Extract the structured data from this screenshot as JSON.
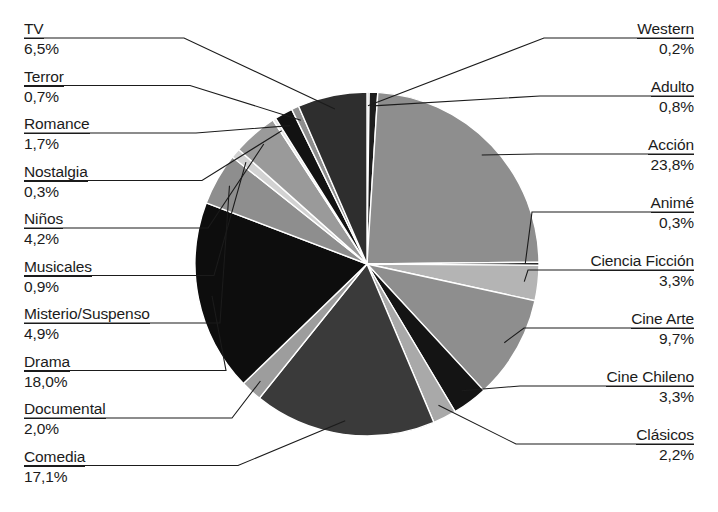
{
  "chart_data": {
    "type": "pie",
    "title": "",
    "xlabel": "",
    "ylabel": "",
    "legend_position": "callout-labels",
    "grid": false,
    "value_suffix": "%",
    "decimal_separator": ",",
    "categories": [
      "Western",
      "Adulto",
      "Acción",
      "Animé",
      "Ciencia Ficción",
      "Cine Arte",
      "Cine Chileno",
      "Clásicos",
      "Comedia",
      "Documental",
      "Drama",
      "Misterio/Suspenso",
      "Musicales",
      "Niños",
      "Nostalgia",
      "Romance",
      "Terror",
      "TV"
    ],
    "values": [
      0.2,
      0.8,
      23.8,
      0.3,
      3.3,
      9.7,
      3.3,
      2.2,
      17.1,
      2.0,
      18.0,
      4.9,
      0.9,
      4.2,
      0.3,
      1.7,
      0.7,
      6.5
    ],
    "labels": [
      {
        "name": "Western",
        "pct": "0,2%",
        "value": 0.2,
        "fill": "#7d7d7d"
      },
      {
        "name": "Adulto",
        "pct": "0,8%",
        "value": 0.8,
        "fill": "#1d1d1d"
      },
      {
        "name": "Acción",
        "pct": "23,8%",
        "value": 23.8,
        "fill": "#8e8e8e"
      },
      {
        "name": "Animé",
        "pct": "0,3%",
        "value": 0.3,
        "fill": "#2a2a2a"
      },
      {
        "name": "Ciencia Ficción",
        "pct": "3,3%",
        "value": 3.3,
        "fill": "#b4b4b4"
      },
      {
        "name": "Cine Arte",
        "pct": "9,7%",
        "value": 9.7,
        "fill": "#8e8e8e"
      },
      {
        "name": "Cine Chileno",
        "pct": "3,3%",
        "value": 3.3,
        "fill": "#141414"
      },
      {
        "name": "Clásicos",
        "pct": "2,2%",
        "value": 2.2,
        "fill": "#a9a9a9"
      },
      {
        "name": "Comedia",
        "pct": "17,1%",
        "value": 17.1,
        "fill": "#3a3a3a"
      },
      {
        "name": "Documental",
        "pct": "2,0%",
        "value": 2.0,
        "fill": "#9d9d9d"
      },
      {
        "name": "Drama",
        "pct": "18,0%",
        "value": 18.0,
        "fill": "#0d0d0d"
      },
      {
        "name": "Misterio/Suspenso",
        "pct": "4,9%",
        "value": 4.9,
        "fill": "#8e8e8e"
      },
      {
        "name": "Musicales",
        "pct": "0,9%",
        "value": 0.9,
        "fill": "#d2d2d2"
      },
      {
        "name": "Niños",
        "pct": "4,2%",
        "value": 4.2,
        "fill": "#9a9a9a"
      },
      {
        "name": "Nostalgia",
        "pct": "0,3%",
        "value": 0.3,
        "fill": "#e6e6e6"
      },
      {
        "name": "Romance",
        "pct": "1,7%",
        "value": 1.7,
        "fill": "#121212"
      },
      {
        "name": "Terror",
        "pct": "0,7%",
        "value": 0.7,
        "fill": "#8e8e8e"
      },
      {
        "name": "TV",
        "pct": "6,5%",
        "value": 6.5,
        "fill": "#2e2e2e"
      }
    ]
  },
  "left_labels": [
    {
      "name": "TV",
      "pct": "6,5%"
    },
    {
      "name": "Terror",
      "pct": "0,7%"
    },
    {
      "name": "Romance",
      "pct": "1,7%"
    },
    {
      "name": "Nostalgia",
      "pct": "0,3%"
    },
    {
      "name": "Niños",
      "pct": "4,2%"
    },
    {
      "name": "Musicales",
      "pct": "0,9%"
    },
    {
      "name": "Misterio/Suspenso",
      "pct": "4,9%"
    },
    {
      "name": "Drama",
      "pct": "18,0%"
    },
    {
      "name": "Documental",
      "pct": "2,0%"
    },
    {
      "name": "Comedia",
      "pct": "17,1%"
    }
  ],
  "right_labels": [
    {
      "name": "Western",
      "pct": "0,2%"
    },
    {
      "name": "Adulto",
      "pct": "0,8%"
    },
    {
      "name": "Acción",
      "pct": "23,8%"
    },
    {
      "name": "Animé",
      "pct": "0,3%"
    },
    {
      "name": "Ciencia Ficción",
      "pct": "3,3%"
    },
    {
      "name": "Cine Arte",
      "pct": "9,7%"
    },
    {
      "name": "Cine Chileno",
      "pct": "3,3%"
    },
    {
      "name": "Clásicos",
      "pct": "2,2%"
    }
  ],
  "geometry": {
    "center_x": 367,
    "center_y": 264,
    "radius": 172,
    "start_angle_deg": -90
  }
}
